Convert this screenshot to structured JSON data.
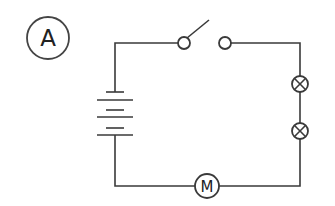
{
  "diagram": {
    "type": "circuit-schematic",
    "label": "A",
    "motor_symbol": "M",
    "components": [
      {
        "name": "battery",
        "kind": "multi-cell battery",
        "cells": 3
      },
      {
        "name": "switch",
        "kind": "single-pole switch",
        "state": "open"
      },
      {
        "name": "lamp-1",
        "kind": "lamp"
      },
      {
        "name": "lamp-2",
        "kind": "lamp"
      },
      {
        "name": "motor",
        "kind": "motor",
        "symbol": "M"
      }
    ],
    "connection": "series",
    "colors": {
      "line": "#3a3a3a",
      "background": "#ffffff"
    }
  }
}
